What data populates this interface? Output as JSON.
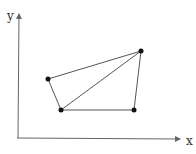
{
  "diagram": {
    "axes": {
      "x_label": "x",
      "y_label": "y",
      "origin": [
        17,
        138
      ],
      "x_end": [
        182,
        138
      ],
      "y_end": [
        19,
        13
      ]
    },
    "vertices": [
      {
        "id": "A",
        "x": 48,
        "y": 79
      },
      {
        "id": "B",
        "x": 61,
        "y": 110
      },
      {
        "id": "C",
        "x": 134,
        "y": 110
      },
      {
        "id": "D",
        "x": 141,
        "y": 51
      }
    ],
    "edges": [
      [
        "A",
        "B"
      ],
      [
        "B",
        "C"
      ],
      [
        "C",
        "D"
      ],
      [
        "D",
        "A"
      ],
      [
        "B",
        "D"
      ]
    ],
    "colors": {
      "line": "#555555",
      "vertex": "#111111",
      "axis": "#666666"
    }
  }
}
